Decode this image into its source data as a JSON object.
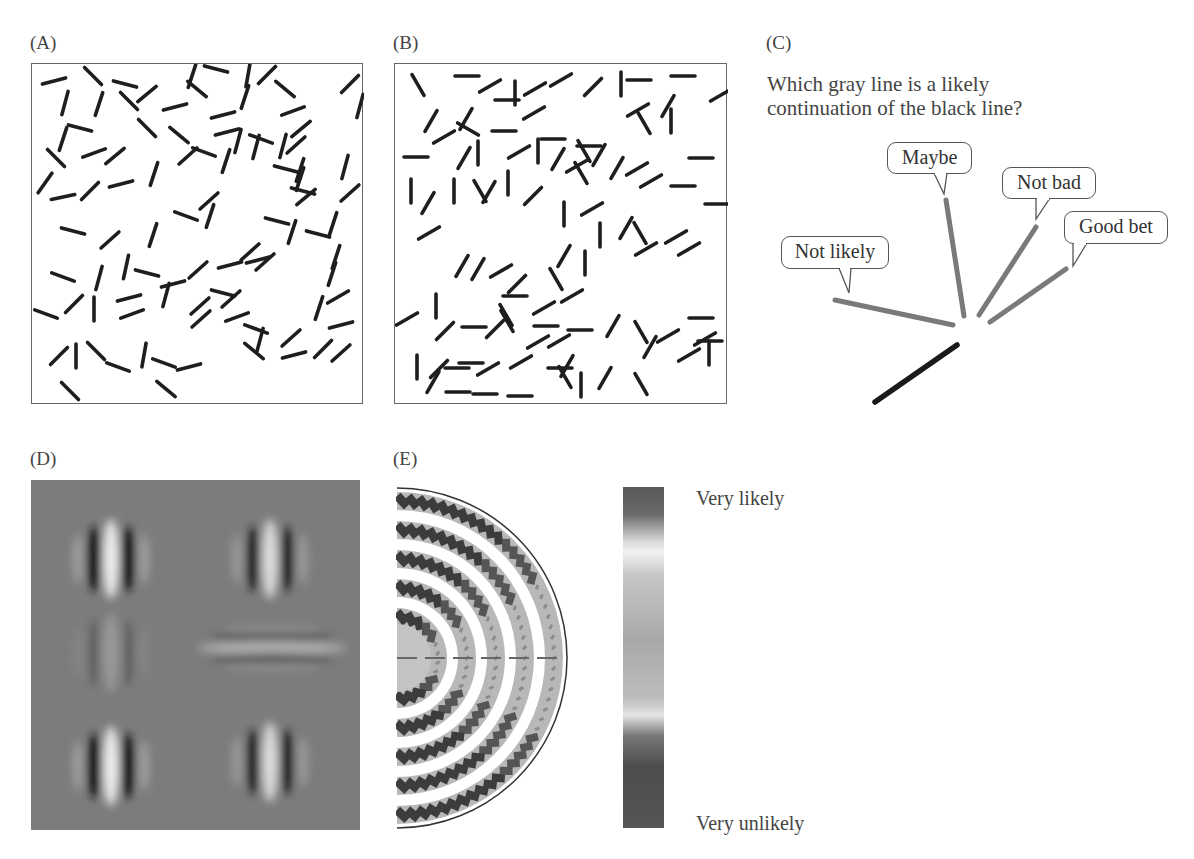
{
  "panels": {
    "A": {
      "label": "(A)",
      "description": "Randomly oriented line segments in a box",
      "segments": [
        [
          53,
          80,
          -15
        ],
        [
          92,
          75,
          45
        ],
        [
          124,
          83,
          15
        ],
        [
          146,
          93,
          -40
        ],
        [
          64,
          102,
          -75
        ],
        [
          98,
          103,
          -72
        ],
        [
          128,
          100,
          45
        ],
        [
          62,
          138,
          -72
        ],
        [
          79,
          127,
          15
        ],
        [
          146,
          127,
          45
        ],
        [
          55,
          157,
          45
        ],
        [
          93,
          152,
          -20
        ],
        [
          114,
          155,
          -40
        ],
        [
          44,
          182,
          -55
        ],
        [
          62,
          196,
          -12
        ],
        [
          89,
          190,
          -45
        ],
        [
          120,
          183,
          -15
        ],
        [
          153,
          173,
          -72
        ],
        [
          178,
          134,
          40
        ],
        [
          187,
          155,
          -42
        ],
        [
          203,
          151,
          20
        ],
        [
          72,
          230,
          15
        ],
        [
          109,
          239,
          -42
        ],
        [
          152,
          234,
          -72
        ],
        [
          146,
          272,
          15
        ],
        [
          172,
          283,
          -15
        ],
        [
          197,
          269,
          -42
        ],
        [
          62,
          276,
          20
        ],
        [
          98,
          277,
          -75
        ],
        [
          125,
          266,
          -78
        ],
        [
          131,
          313,
          -20
        ],
        [
          200,
          318,
          -42
        ],
        [
          230,
          298,
          -42
        ],
        [
          45,
          313,
          20
        ],
        [
          73,
          303,
          -45
        ],
        [
          93,
          308,
          -90
        ],
        [
          128,
          297,
          -15
        ],
        [
          165,
          294,
          -75
        ],
        [
          199,
          305,
          -42
        ],
        [
          222,
          292,
          15
        ],
        [
          58,
          355,
          -45
        ],
        [
          75,
          355,
          -90
        ],
        [
          95,
          350,
          45
        ],
        [
          117,
          366,
          20
        ],
        [
          143,
          354,
          -80
        ],
        [
          163,
          362,
          20
        ],
        [
          165,
          388,
          40
        ],
        [
          188,
          366,
          -15
        ],
        [
          69,
          390,
          45
        ],
        [
          222,
          114,
          -15
        ],
        [
          191,
          75,
          -72
        ],
        [
          215,
          68,
          15
        ],
        [
          244,
          96,
          -72
        ],
        [
          247,
          74,
          -80
        ],
        [
          266,
          74,
          -45
        ],
        [
          284,
          88,
          40
        ],
        [
          226,
          131,
          -15
        ],
        [
          225,
          160,
          -72
        ],
        [
          237,
          140,
          -75
        ],
        [
          260,
          138,
          20
        ],
        [
          282,
          145,
          -75
        ],
        [
          295,
          144,
          -42
        ],
        [
          285,
          168,
          15
        ],
        [
          299,
          169,
          -72
        ],
        [
          299,
          178,
          -72
        ],
        [
          302,
          190,
          15
        ],
        [
          305,
          196,
          -40
        ],
        [
          291,
          231,
          -72
        ],
        [
          317,
          233,
          15
        ],
        [
          332,
          223,
          -72
        ],
        [
          344,
          166,
          -75
        ],
        [
          349,
          192,
          -42
        ],
        [
          257,
          259,
          -15
        ],
        [
          229,
          264,
          -15
        ],
        [
          249,
          251,
          -42
        ],
        [
          264,
          261,
          -42
        ],
        [
          276,
          220,
          15
        ],
        [
          209,
          215,
          -72
        ],
        [
          185,
          215,
          20
        ],
        [
          208,
          200,
          -42
        ],
        [
          236,
          316,
          -20
        ],
        [
          255,
          328,
          20
        ],
        [
          259,
          339,
          -75
        ],
        [
          253,
          350,
          40
        ],
        [
          290,
          337,
          -42
        ],
        [
          293,
          354,
          -15
        ],
        [
          322,
          348,
          -45
        ],
        [
          340,
          352,
          -42
        ],
        [
          340,
          324,
          -15
        ],
        [
          318,
          307,
          -72
        ],
        [
          335,
          256,
          -72
        ],
        [
          331,
          273,
          -72
        ],
        [
          337,
          296,
          -30
        ],
        [
          359,
          105,
          -75
        ],
        [
          349,
          83,
          -45
        ],
        [
          174,
          106,
          -15
        ],
        [
          196,
          88,
          40
        ],
        [
          292,
          110,
          -20
        ],
        [
          300,
          128,
          -40
        ],
        [
          255,
          146,
          -75
        ]
      ]
    },
    "B": {
      "label": "(B)",
      "description": "Line segments with some aligned contour elements",
      "segments": [
        [
          417,
          84,
          60
        ],
        [
          466,
          75,
          0
        ],
        [
          489,
          85,
          -30
        ],
        [
          514,
          92,
          90
        ],
        [
          506,
          99,
          0
        ],
        [
          534,
          88,
          -30
        ],
        [
          560,
          79,
          -30
        ],
        [
          592,
          86,
          -45
        ],
        [
          620,
          83,
          90
        ],
        [
          638,
          79,
          0
        ],
        [
          682,
          75,
          0
        ],
        [
          720,
          94,
          -30
        ],
        [
          430,
          120,
          -60
        ],
        [
          465,
          118,
          -60
        ],
        [
          443,
          136,
          -30
        ],
        [
          467,
          128,
          30
        ],
        [
          503,
          130,
          0
        ],
        [
          533,
          112,
          -30
        ],
        [
          552,
          138,
          0
        ],
        [
          588,
          145,
          0
        ],
        [
          583,
          150,
          60
        ],
        [
          598,
          154,
          -60
        ],
        [
          643,
          122,
          60
        ],
        [
          637,
          109,
          -30
        ],
        [
          667,
          105,
          -60
        ],
        [
          670,
          120,
          90
        ],
        [
          700,
          157,
          0
        ],
        [
          415,
          156,
          0
        ],
        [
          463,
          157,
          -60
        ],
        [
          477,
          152,
          90
        ],
        [
          518,
          151,
          -30
        ],
        [
          537,
          150,
          90
        ],
        [
          557,
          158,
          -60
        ],
        [
          576,
          165,
          -30
        ],
        [
          580,
          172,
          60
        ],
        [
          616,
          167,
          -60
        ],
        [
          636,
          168,
          -30
        ],
        [
          650,
          180,
          -30
        ],
        [
          682,
          185,
          0
        ],
        [
          716,
          203,
          0
        ],
        [
          410,
          190,
          90
        ],
        [
          427,
          202,
          -60
        ],
        [
          453,
          190,
          90
        ],
        [
          479,
          190,
          60
        ],
        [
          488,
          191,
          -60
        ],
        [
          507,
          182,
          90
        ],
        [
          532,
          195,
          -45
        ],
        [
          563,
          213,
          90
        ],
        [
          591,
          208,
          -30
        ],
        [
          599,
          234,
          90
        ],
        [
          625,
          227,
          -60
        ],
        [
          639,
          232,
          60
        ],
        [
          645,
          248,
          -30
        ],
        [
          675,
          236,
          -30
        ],
        [
          688,
          248,
          -30
        ],
        [
          428,
          232,
          -30
        ],
        [
          461,
          265,
          -60
        ],
        [
          477,
          268,
          -60
        ],
        [
          500,
          270,
          -30
        ],
        [
          516,
          283,
          -45
        ],
        [
          563,
          255,
          -60
        ],
        [
          571,
          295,
          -30
        ],
        [
          555,
          278,
          60
        ],
        [
          584,
          262,
          90
        ],
        [
          514,
          295,
          0
        ],
        [
          505,
          314,
          60
        ],
        [
          543,
          307,
          -30
        ],
        [
          545,
          325,
          0
        ],
        [
          558,
          340,
          -30
        ],
        [
          579,
          329,
          0
        ],
        [
          612,
          325,
          -60
        ],
        [
          406,
          318,
          -30
        ],
        [
          435,
          305,
          90
        ],
        [
          444,
          330,
          -45
        ],
        [
          473,
          326,
          0
        ],
        [
          494,
          328,
          -45
        ],
        [
          506,
          320,
          60
        ],
        [
          537,
          341,
          -30
        ],
        [
          566,
          365,
          -60
        ],
        [
          559,
          367,
          0
        ],
        [
          640,
          331,
          60
        ],
        [
          649,
          346,
          -60
        ],
        [
          667,
          335,
          -30
        ],
        [
          704,
          338,
          -30
        ],
        [
          700,
          317,
          0
        ],
        [
          709,
          340,
          0
        ],
        [
          416,
          366,
          90
        ],
        [
          438,
          368,
          -45
        ],
        [
          470,
          362,
          0
        ],
        [
          487,
          368,
          -30
        ],
        [
          520,
          361,
          -30
        ],
        [
          519,
          395,
          0
        ],
        [
          580,
          384,
          90
        ],
        [
          564,
          376,
          60
        ],
        [
          604,
          377,
          -60
        ],
        [
          640,
          383,
          60
        ],
        [
          432,
          381,
          -60
        ],
        [
          456,
          367,
          0
        ],
        [
          457,
          391,
          0
        ],
        [
          484,
          393,
          0
        ],
        [
          688,
          354,
          -30
        ],
        [
          708,
          352,
          90
        ]
      ]
    },
    "C": {
      "label": "(C)",
      "question": "Which gray line is a likely continuation of the black line?",
      "black_line": {
        "x1": 875,
        "y1": 402,
        "x2": 957,
        "y2": 345,
        "color": "#1a1a1a"
      },
      "gray_color": "#7a7a7a",
      "options": [
        {
          "label": "Not likely",
          "bubble": {
            "x": 781,
            "y": 236,
            "w": 108,
            "h": 33
          },
          "tail": [
            839,
            268,
            851,
            268,
            849,
            293
          ],
          "line": {
            "x1": 835,
            "y1": 300,
            "x2": 953,
            "y2": 325
          }
        },
        {
          "label": "Maybe",
          "bubble": {
            "x": 887,
            "y": 142,
            "w": 85,
            "h": 32
          },
          "tail": [
            934,
            173,
            947,
            173,
            944,
            194
          ],
          "line": {
            "x1": 946,
            "y1": 200,
            "x2": 964,
            "y2": 316
          }
        },
        {
          "label": "Not bad",
          "bubble": {
            "x": 1002,
            "y": 167,
            "w": 94,
            "h": 32
          },
          "tail": [
            1036,
            198,
            1050,
            198,
            1036,
            219
          ],
          "line": {
            "x1": 1036,
            "y1": 227,
            "x2": 979,
            "y2": 315
          }
        },
        {
          "label": "Good bet",
          "bubble": {
            "x": 1064,
            "y": 211,
            "w": 104,
            "h": 33
          },
          "tail": [
            1073,
            243,
            1087,
            243,
            1073,
            266
          ],
          "line": {
            "x1": 1066,
            "y1": 269,
            "x2": 990,
            "y2": 322
          }
        }
      ]
    },
    "D": {
      "label": "(D)",
      "description": "Gabor filter patches on gray background",
      "background": "#7c7c7c",
      "patches": [
        {
          "cx": 111,
          "cy": 559,
          "orientation": "vertical",
          "strength": 1.0
        },
        {
          "cx": 111,
          "cy": 653,
          "orientation": "vertical",
          "strength": 0.25
        },
        {
          "cx": 111,
          "cy": 766,
          "orientation": "vertical",
          "strength": 1.0
        },
        {
          "cx": 270,
          "cy": 559,
          "orientation": "vertical",
          "strength": 0.85
        },
        {
          "cx": 272,
          "cy": 648,
          "orientation": "horizontal",
          "strength": 0.45
        },
        {
          "cx": 270,
          "cy": 762,
          "orientation": "vertical",
          "strength": 0.85
        }
      ]
    },
    "E": {
      "label": "(E)",
      "description": "Association field: semicircular map of likelihood",
      "rings": 6,
      "colorbar": {
        "top_label": "Very likely",
        "bottom_label": "Very unlikely",
        "stops": [
          {
            "pos": 0,
            "color": "#585858"
          },
          {
            "pos": 8,
            "color": "#6a6a6a"
          },
          {
            "pos": 16,
            "color": "#d8d8d8"
          },
          {
            "pos": 19,
            "color": "#f2f2f2"
          },
          {
            "pos": 26,
            "color": "#c6c6c6"
          },
          {
            "pos": 45,
            "color": "#a9a9a9"
          },
          {
            "pos": 62,
            "color": "#bdbdbd"
          },
          {
            "pos": 67,
            "color": "#e4e4e4"
          },
          {
            "pos": 73,
            "color": "#777777"
          },
          {
            "pos": 82,
            "color": "#4d4d4d"
          },
          {
            "pos": 100,
            "color": "#555555"
          }
        ]
      }
    }
  }
}
